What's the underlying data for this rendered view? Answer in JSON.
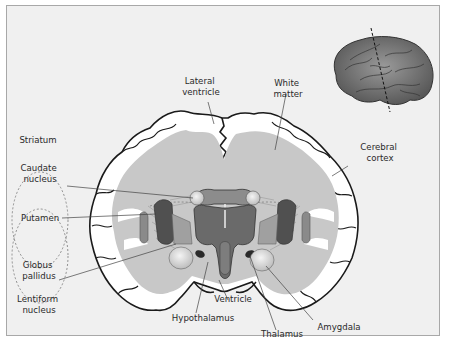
{
  "diagram": {
    "type": "anatomical coronal section of the human brain",
    "labels": {
      "lateral_ventricle": [
        "Lateral",
        "ventricle"
      ],
      "white_matter": [
        "White",
        "matter"
      ],
      "cerebral_cortex": [
        "Cerebral",
        "cortex"
      ],
      "striatum": "Striatum",
      "caudate_nucleus": [
        "Caudate",
        "nucleus"
      ],
      "putamen": "Putamen",
      "globus_pallidus": [
        "Globus",
        "pallidus"
      ],
      "lentiform_nucleus": [
        "Lentiform",
        "nucleus"
      ],
      "ventricle": "Ventricle",
      "hypothalamus": "Hypothalamus",
      "thalamus": "Thalamus",
      "amygdala": "Amygdala"
    },
    "inset": {
      "description": "lateral view of brain with dashed line indicating coronal section plane",
      "icon": "brain-side-view-icon"
    },
    "colors": {
      "background": "#f0f0f0",
      "frame_border": "#a8a8a8",
      "cortex_gray": "#ffffff",
      "white_matter": "#c8c8c8",
      "putamen": "#555555",
      "globus_pallidus": "#8c8c8c",
      "caudate": "#d9d9d9",
      "thalamus": "#e0e0e0",
      "brain_inset": "#6e6e6e",
      "outline": "#1a1a1a"
    }
  }
}
